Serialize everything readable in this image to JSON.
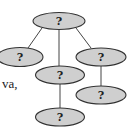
{
  "diagram": {
    "type": "tree",
    "colors": {
      "node_fill": "#cfcfcf",
      "node_stroke": "#333333",
      "edge": "#444444"
    },
    "nodes": [
      {
        "id": "root",
        "label": "?",
        "cx": 59,
        "cy": 21,
        "rx": 26,
        "ry": 8.5
      },
      {
        "id": "left",
        "label": "?",
        "cx": 20,
        "cy": 57,
        "rx": 23,
        "ry": 9.5
      },
      {
        "id": "middle",
        "label": "?",
        "cx": 60,
        "cy": 75,
        "rx": 24.5,
        "ry": 9
      },
      {
        "id": "right",
        "label": "?",
        "cx": 101,
        "cy": 57,
        "rx": 25,
        "ry": 9
      },
      {
        "id": "bottom",
        "label": "?",
        "cx": 60,
        "cy": 117,
        "rx": 24.5,
        "ry": 9
      },
      {
        "id": "right-child",
        "label": "?",
        "cx": 101,
        "cy": 95,
        "rx": 25,
        "ry": 9
      }
    ],
    "edges": [
      {
        "from": "root",
        "to": "left",
        "x1": 42,
        "y1": 28,
        "x2": 28,
        "y2": 48
      },
      {
        "from": "root",
        "to": "middle",
        "x1": 59,
        "y1": 29,
        "x2": 59,
        "y2": 66
      },
      {
        "from": "root",
        "to": "right",
        "x1": 76,
        "y1": 28,
        "x2": 91,
        "y2": 48
      },
      {
        "from": "middle",
        "to": "bottom",
        "x1": 60,
        "y1": 84,
        "x2": 60,
        "y2": 108
      },
      {
        "from": "right",
        "to": "right-child",
        "x1": 101,
        "y1": 66,
        "x2": 101,
        "y2": 86
      }
    ]
  },
  "side_text": "va,"
}
